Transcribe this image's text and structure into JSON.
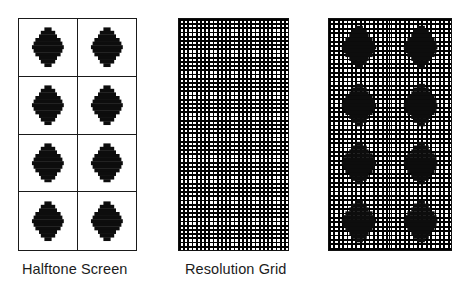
{
  "figure": {
    "background_color": "#ffffff",
    "ink_color": "#000000",
    "width": 469,
    "height": 287
  },
  "panels": [
    {
      "id": "halftone-screen",
      "label": "Halftone Screen",
      "columns": 2,
      "rows": 4,
      "cell_count": 8,
      "shows_resolution_grid": false,
      "border_color": "#1a1a1a"
    },
    {
      "id": "resolution-grid",
      "label": "Resolution Grid",
      "columns": 26,
      "rows": 55,
      "cell_count": 1430,
      "shows_resolution_grid": true,
      "shows_halftone_dots": false,
      "grid_pitch_px": 4.2,
      "border_color": "#111111"
    },
    {
      "id": "combined",
      "label": "",
      "columns": 2,
      "rows": 4,
      "cell_count": 8,
      "shows_resolution_grid": true,
      "shows_halftone_dots": true,
      "grid_pitch_px": 4.4,
      "border_color": "#111111"
    }
  ],
  "dots": {
    "shape": "stepped-diamond",
    "fill_color": "#0d0d0d",
    "step_rows": [
      2,
      4,
      5,
      7,
      8,
      9,
      8,
      7,
      5,
      4,
      2
    ],
    "row_unit_px": 3.6,
    "count_per_panel": 8
  },
  "labels": {
    "halftone_screen": "Halftone Screen",
    "resolution_grid": "Resolution Grid"
  }
}
